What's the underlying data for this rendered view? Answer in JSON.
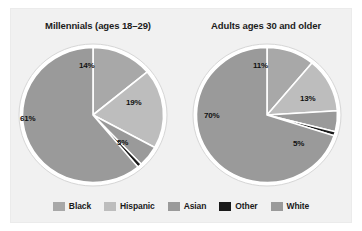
{
  "figure": {
    "background": "#f1f1f1",
    "page_background": "#ffffff"
  },
  "legend": {
    "items": [
      {
        "label": "Black",
        "color": "#a8a8a8",
        "key": "black"
      },
      {
        "label": "Hispanic",
        "color": "#bdbdbd",
        "key": "hispanic"
      },
      {
        "label": "Asian",
        "color": "#9a9a9a",
        "key": "asian"
      },
      {
        "label": "Other",
        "color": "#1a1a1a",
        "key": "other"
      },
      {
        "label": "White",
        "color": "#9a9a9a",
        "key": "white"
      }
    ]
  },
  "chart_data": [
    {
      "type": "pie",
      "id": "millennials",
      "title": "Millennials (ages 18–29)",
      "categories": [
        "Black",
        "Hispanic",
        "Asian",
        "Other",
        "White"
      ],
      "values": [
        14,
        19,
        5,
        1,
        61
      ],
      "data_labels": [
        "14%",
        "19%",
        "5%",
        "",
        "61%"
      ],
      "colors": [
        "#a8a8a8",
        "#bdbdbd",
        "#9a9a9a",
        "#1a1a1a",
        "#9a9a9a"
      ],
      "start_angle": 0,
      "direction": "clockwise",
      "slice_border": "#ffffff",
      "legend_position": "bottom"
    },
    {
      "type": "pie",
      "id": "adults-30-plus",
      "title": "Adults ages 30 and older",
      "categories": [
        "Black",
        "Hispanic",
        "Asian",
        "Other",
        "White"
      ],
      "values": [
        11,
        13,
        5,
        1,
        70
      ],
      "data_labels": [
        "11%",
        "13%",
        "5%",
        "",
        "70%"
      ],
      "colors": [
        "#a8a8a8",
        "#bdbdbd",
        "#9a9a9a",
        "#1a1a1a",
        "#9a9a9a"
      ],
      "start_angle": 0,
      "direction": "clockwise",
      "slice_border": "#ffffff",
      "legend_position": "bottom"
    }
  ],
  "labels": {
    "left": {
      "black": "14%",
      "hispanic": "19%",
      "asian": "5%",
      "white": "61%"
    },
    "right": {
      "black": "11%",
      "hispanic": "13%",
      "asian": "5%",
      "white": "70%"
    }
  }
}
